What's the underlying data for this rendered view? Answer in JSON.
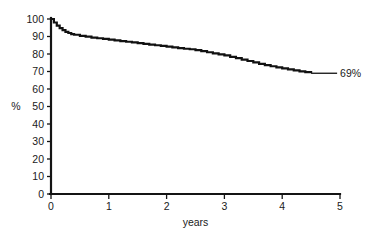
{
  "chart_data": {
    "type": "line",
    "title": "",
    "subtitle": "",
    "xlabel": "years",
    "ylabel": "%",
    "xlim": [
      0,
      5
    ],
    "ylim": [
      0,
      100
    ],
    "grid": false,
    "legend": null,
    "x_ticks": [
      0,
      1,
      2,
      3,
      4,
      5
    ],
    "x_tick_labels": [
      "0",
      "1",
      "2",
      "3",
      "4",
      "5"
    ],
    "y_ticks": [
      0,
      10,
      20,
      30,
      40,
      50,
      60,
      70,
      80,
      90,
      100
    ],
    "y_tick_labels": [
      "0",
      "10",
      "20",
      "30",
      "40",
      "50",
      "60",
      "70",
      "80",
      "90",
      "100"
    ],
    "annotations": [
      {
        "text": "69%",
        "x": 4.95,
        "y": 69,
        "leader_from_x": 4.5,
        "leader_to_x": 4.95
      }
    ],
    "series": [
      {
        "name": "survival",
        "style": "step-like descending curve",
        "x": [
          0,
          0.05,
          0.1,
          0.15,
          0.2,
          0.25,
          0.3,
          0.35,
          0.4,
          0.5,
          0.6,
          0.7,
          0.8,
          0.9,
          1.0,
          1.1,
          1.2,
          1.3,
          1.4,
          1.5,
          1.6,
          1.7,
          1.8,
          1.9,
          2.0,
          2.1,
          2.2,
          2.3,
          2.4,
          2.5,
          2.6,
          2.7,
          2.8,
          2.9,
          3.0,
          3.1,
          3.2,
          3.3,
          3.4,
          3.5,
          3.6,
          3.7,
          3.8,
          3.9,
          4.0,
          4.1,
          4.2,
          4.3,
          4.4,
          4.5
        ],
        "y": [
          100,
          98.0,
          96.2,
          94.8,
          93.6,
          92.7,
          92.0,
          91.4,
          91.0,
          90.4,
          89.9,
          89.4,
          89.0,
          88.6,
          88.2,
          87.8,
          87.4,
          87.0,
          86.6,
          86.2,
          85.8,
          85.4,
          85.0,
          84.6,
          84.2,
          83.8,
          83.4,
          83.0,
          82.7,
          82.2,
          81.6,
          81.0,
          80.4,
          79.8,
          79.2,
          78.4,
          77.6,
          76.8,
          76.0,
          75.2,
          74.4,
          73.6,
          73.0,
          72.4,
          71.8,
          71.2,
          70.6,
          70.1,
          69.6,
          69.0
        ]
      }
    ]
  },
  "axis": {
    "y_title": "%",
    "x_title": "years"
  }
}
